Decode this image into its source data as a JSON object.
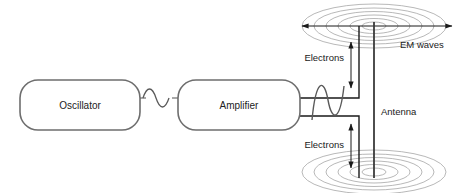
{
  "diagram": {
    "background_color": "#ffffff",
    "blocks": [
      {
        "id": "oscillator",
        "label": "Oscillator",
        "x": 20,
        "y": 80,
        "width": 120,
        "height": 50,
        "corner_radius": 18,
        "stroke": "#6e6e6e",
        "fill": "#ffffff"
      },
      {
        "id": "amplifier",
        "label": "Amplifier",
        "x": 178,
        "y": 80,
        "width": 122,
        "height": 50,
        "corner_radius": 18,
        "stroke": "#6e6e6e",
        "fill": "#ffffff"
      }
    ],
    "labels": {
      "em_waves": "EM waves",
      "antenna": "Antenna",
      "electrons_top": "Electrons",
      "electrons_bottom": "Electrons"
    },
    "waves": {
      "small_signal_label": "low amplitude sine wave",
      "large_signal_label": "high amplitude sine wave",
      "small_amplitude": 9,
      "large_amplitude": 24
    },
    "em_wave_rings": {
      "top_center_x": 374,
      "top_center_y": 26,
      "bottom_center_x": 374,
      "bottom_center_y": 172,
      "ring_count": 6,
      "max_rx": 72,
      "max_ry": 22,
      "stroke": "#9a9a9a"
    },
    "colors": {
      "block_stroke": "#6e6e6e",
      "wire_stroke": "#1a1a1a",
      "wave_stroke": "#5a5a5a",
      "ring_stroke": "#9a9a9a",
      "text": "#1a1a1a",
      "arrow": "#1a1a1a"
    },
    "antenna": {
      "rod_x": 374,
      "rod_top": 22,
      "rod_bottom": 178
    }
  }
}
